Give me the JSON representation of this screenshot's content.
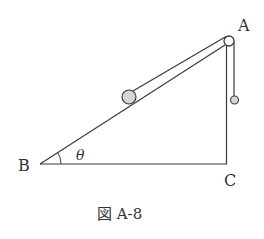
{
  "figure": {
    "caption": "図 A-8",
    "labels": {
      "A": "A",
      "B": "B",
      "C": "C",
      "angle": "θ"
    },
    "colors": {
      "line": "#3a3a3a",
      "ball_fill": "#d6d6d6",
      "pulley_fill": "#ffffff",
      "text": "#333333"
    },
    "elements": {
      "triangle": {
        "B": [
          40,
          164
        ],
        "C": [
          227,
          164
        ],
        "A": [
          227,
          42
        ]
      },
      "pulley": {
        "cx": 229,
        "cy": 41,
        "r": 5
      },
      "ball_on_incline": {
        "cx": 129,
        "cy": 97,
        "r": 7
      },
      "hanging_ball": {
        "cx": 235,
        "cy": 100,
        "r": 4
      }
    }
  }
}
